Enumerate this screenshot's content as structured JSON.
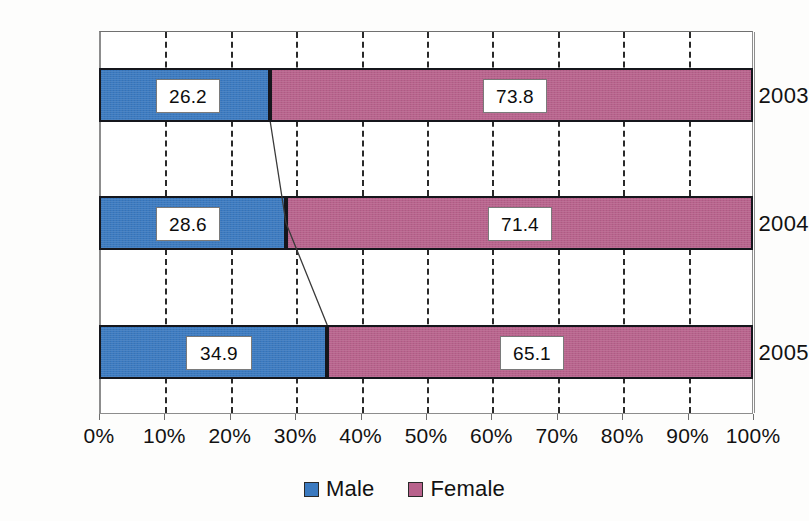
{
  "chart_data": {
    "type": "bar",
    "orientation": "horizontal",
    "stacked": true,
    "normalized_percent": true,
    "title": "",
    "subtitle": "",
    "xlabel": "",
    "ylabel": "",
    "categories": [
      "2003",
      "2004",
      "2005"
    ],
    "series": [
      {
        "name": "Male",
        "color": "#3b7ac0",
        "values": [
          26.2,
          28.6,
          34.9
        ]
      },
      {
        "name": "Female",
        "color": "#b8628c",
        "values": [
          73.8,
          71.4,
          65.1
        ]
      }
    ],
    "xlim": [
      0,
      100
    ],
    "xticks": [
      0,
      10,
      20,
      30,
      40,
      50,
      60,
      70,
      80,
      90,
      100
    ],
    "xtick_labels": [
      "0%",
      "10%",
      "20%",
      "30%",
      "40%",
      "50%",
      "60%",
      "70%",
      "80%",
      "90%",
      "100%"
    ],
    "grid": "vertical-dashed",
    "legend_position": "bottom-center",
    "data_labels": [
      {
        "category": "2003",
        "series": "Male",
        "text": "26.2"
      },
      {
        "category": "2003",
        "series": "Female",
        "text": "73.8"
      },
      {
        "category": "2004",
        "series": "Male",
        "text": "28.6"
      },
      {
        "category": "2004",
        "series": "Female",
        "text": "71.4"
      },
      {
        "category": "2005",
        "series": "Male",
        "text": "34.9"
      },
      {
        "category": "2005",
        "series": "Female",
        "text": "65.1"
      }
    ],
    "annotations": [
      {
        "type": "series-connector-line",
        "series": "Male",
        "description": "thin line joining Male/Female boundary of 2003, 2004 and 2005 bars"
      }
    ]
  },
  "axis": {
    "ticks": [
      {
        "label": "0%",
        "value": 0
      },
      {
        "label": "10%",
        "value": 10
      },
      {
        "label": "20%",
        "value": 20
      },
      {
        "label": "30%",
        "value": 30
      },
      {
        "label": "40%",
        "value": 40
      },
      {
        "label": "50%",
        "value": 50
      },
      {
        "label": "60%",
        "value": 60
      },
      {
        "label": "70%",
        "value": 70
      },
      {
        "label": "80%",
        "value": 80
      },
      {
        "label": "90%",
        "value": 90
      },
      {
        "label": "100%",
        "value": 100
      }
    ]
  },
  "categories": [
    {
      "label": "2003"
    },
    {
      "label": "2004"
    },
    {
      "label": "2005"
    }
  ],
  "legend": {
    "items": [
      {
        "label": "Male",
        "color": "#3b7ac0"
      },
      {
        "label": "Female",
        "color": "#b8628c"
      }
    ]
  },
  "colors": {
    "male": "#3b7ac0",
    "female": "#b8628c",
    "bar_outline": "#15161c",
    "grid": "#2a2a2a",
    "frame": "#8d8d8d",
    "text": "#121212",
    "background": "#fdfdfc"
  }
}
